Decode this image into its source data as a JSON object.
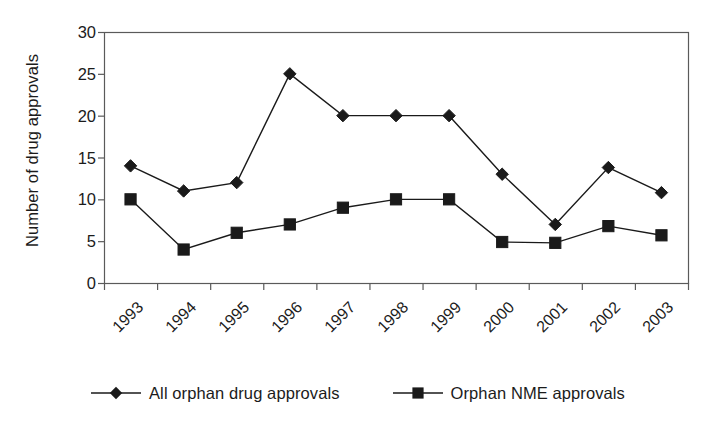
{
  "chart_data": {
    "type": "line",
    "title": "",
    "xlabel": "",
    "ylabel": "Number of drug approvals",
    "categories": [
      "1993",
      "1994",
      "1995",
      "1996",
      "1997",
      "1998",
      "1999",
      "2000",
      "2001",
      "2002",
      "2003"
    ],
    "ylim": [
      0,
      30
    ],
    "y_ticks": [
      0,
      5,
      10,
      15,
      20,
      25,
      30
    ],
    "y_tick_labels": [
      "0",
      "5",
      "10",
      "15",
      "20",
      "25",
      "30"
    ],
    "grid": false,
    "legend_position": "bottom",
    "series": [
      {
        "name": "All orphan drug approvals",
        "marker": "diamond",
        "color": "#1a1a1a",
        "values": [
          14,
          11,
          12,
          25,
          20,
          20,
          20,
          13,
          7,
          13.8,
          10.8
        ]
      },
      {
        "name": "Orphan NME approvals",
        "marker": "square",
        "color": "#1a1a1a",
        "values": [
          10,
          4,
          6,
          7,
          9,
          10,
          10,
          4.9,
          4.8,
          6.8,
          5.7
        ]
      }
    ]
  },
  "legend": {
    "entries": [
      {
        "label": "All orphan drug approvals",
        "marker": "diamond-marker-icon"
      },
      {
        "label": "Orphan NME approvals",
        "marker": "square-marker-icon"
      }
    ]
  },
  "axes": {
    "y_title": "Number of drug approvals"
  },
  "colors": {
    "series_line": "#1a1a1a",
    "axis": "#5a5a5a",
    "background": "#ffffff",
    "text": "#1b1b1b"
  }
}
